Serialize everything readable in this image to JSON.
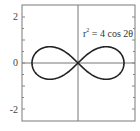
{
  "chart_data": {
    "type": "line",
    "title": "",
    "annotation": "r² = 4 cos 2θ",
    "annotation_base": "r",
    "annotation_sup": "2",
    "annotation_rest": " = 4 cos 2θ",
    "curve": "lemniscate",
    "equation": "r^2 = 4 cos(2θ)",
    "xlabel": "",
    "ylabel": "",
    "xlim": [
      -2.4,
      2.5
    ],
    "ylim": [
      -2.5,
      2.5
    ],
    "yticks": [
      2,
      0,
      -2
    ],
    "ytick_labels": [
      "2",
      "0",
      "-2"
    ],
    "minor_ticks": true,
    "grid": false,
    "axes_through_origin": true,
    "series": [
      {
        "name": "r^2 = 4 cos 2θ",
        "points_sampled": [
          {
            "x": 2.0,
            "y": 0.0
          },
          {
            "x": 1.225,
            "y": 0.707
          },
          {
            "x": 0.0,
            "y": 0.0
          },
          {
            "x": -1.225,
            "y": 0.707
          },
          {
            "x": -2.0,
            "y": 0.0
          },
          {
            "x": -1.225,
            "y": -0.707
          },
          {
            "x": 1.225,
            "y": -0.707
          }
        ]
      }
    ],
    "colors": {
      "curve": "#222222",
      "axes": "#666666",
      "frame": "#777777"
    }
  }
}
